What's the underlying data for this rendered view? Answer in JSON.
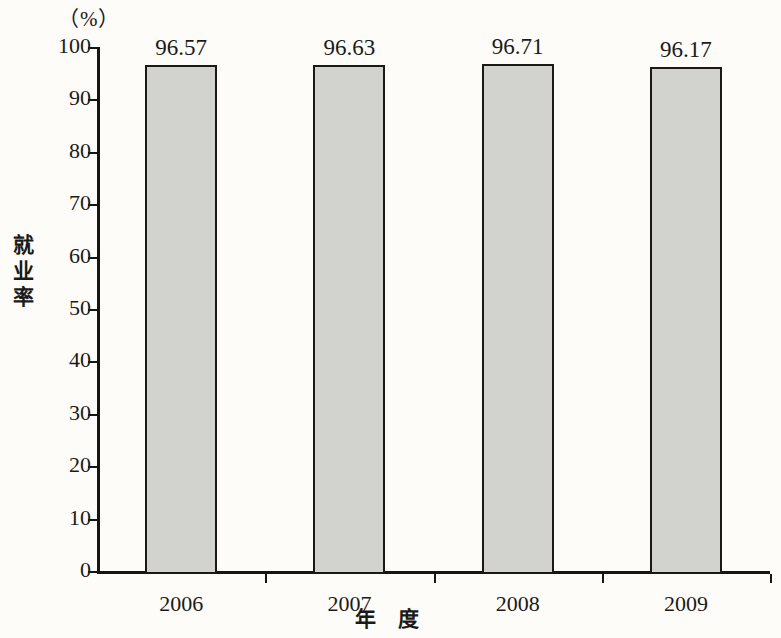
{
  "chart_data": {
    "type": "bar",
    "title": "",
    "subtitle": "",
    "unit_label": "（%）",
    "xlabel": "年 度",
    "ylabel": "就业率",
    "ylabel_chars": [
      "就",
      "业",
      "率"
    ],
    "categories": [
      "2006",
      "2007",
      "2008",
      "2009"
    ],
    "values": [
      96.57,
      96.63,
      96.71,
      96.17
    ],
    "value_labels": [
      "96.57",
      "96.63",
      "96.71",
      "96.17"
    ],
    "series": [
      {
        "name": "就业率",
        "values": [
          96.57,
          96.63,
          96.71,
          96.17
        ]
      }
    ],
    "ylim": [
      0,
      100
    ],
    "y_ticks": [
      0,
      10,
      20,
      30,
      40,
      50,
      60,
      70,
      80,
      90,
      100
    ],
    "y_tick_labels": [
      "0",
      "10",
      "20",
      "30",
      "40",
      "50",
      "60",
      "70",
      "80",
      "90",
      "100"
    ],
    "grid": false,
    "legend": false,
    "legend_position": "none",
    "bar_fill_color": "#d2d2cf",
    "bar_border_color": "#1b1915",
    "axis_color": "#17150f",
    "background_color": "#fdfcf8",
    "text_color": "#1a1a18"
  }
}
